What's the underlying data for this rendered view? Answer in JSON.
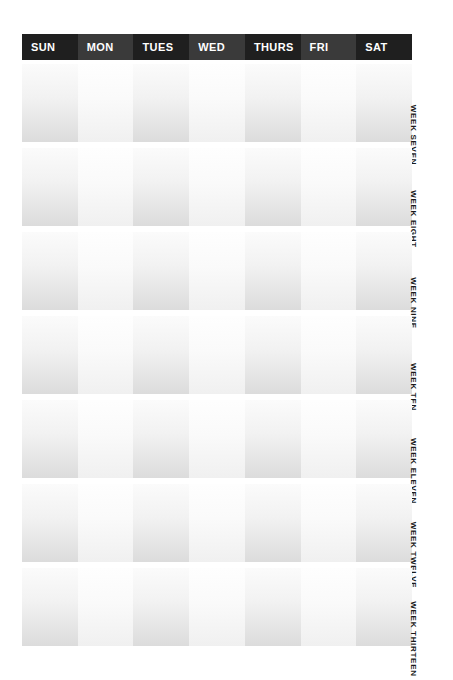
{
  "page": {
    "background_color": "#ffffff",
    "header_color": "#222222",
    "header_text_color": "#ffffff",
    "cell_tint_dark": "#dcdcdc",
    "cell_tint_light": "#f5f5f5",
    "label_text_color": "#1a1a1a"
  },
  "header": {
    "days": [
      {
        "label": "SUN",
        "shade": "dark"
      },
      {
        "label": "MON",
        "shade": "light"
      },
      {
        "label": "TUES",
        "shade": "dark"
      },
      {
        "label": "WED",
        "shade": "light"
      },
      {
        "label": "THURS",
        "shade": "dark"
      },
      {
        "label": "FRI",
        "shade": "light"
      },
      {
        "label": "SAT",
        "shade": "dark"
      }
    ]
  },
  "weeks": [
    {
      "label": "WEEK SEVEN",
      "cells": [
        {
          "day": "SUN",
          "value": ""
        },
        {
          "day": "MON",
          "value": ""
        },
        {
          "day": "TUES",
          "value": ""
        },
        {
          "day": "WED",
          "value": ""
        },
        {
          "day": "THURS",
          "value": ""
        },
        {
          "day": "FRI",
          "value": ""
        },
        {
          "day": "SAT",
          "value": ""
        }
      ]
    },
    {
      "label": "WEEK EIGHT",
      "cells": [
        {
          "day": "SUN",
          "value": ""
        },
        {
          "day": "MON",
          "value": ""
        },
        {
          "day": "TUES",
          "value": ""
        },
        {
          "day": "WED",
          "value": ""
        },
        {
          "day": "THURS",
          "value": ""
        },
        {
          "day": "FRI",
          "value": ""
        },
        {
          "day": "SAT",
          "value": ""
        }
      ]
    },
    {
      "label": "WEEK NINE",
      "cells": [
        {
          "day": "SUN",
          "value": ""
        },
        {
          "day": "MON",
          "value": ""
        },
        {
          "day": "TUES",
          "value": ""
        },
        {
          "day": "WED",
          "value": ""
        },
        {
          "day": "THURS",
          "value": ""
        },
        {
          "day": "FRI",
          "value": ""
        },
        {
          "day": "SAT",
          "value": ""
        }
      ]
    },
    {
      "label": "WEEK TEN",
      "cells": [
        {
          "day": "SUN",
          "value": ""
        },
        {
          "day": "MON",
          "value": ""
        },
        {
          "day": "TUES",
          "value": ""
        },
        {
          "day": "WED",
          "value": ""
        },
        {
          "day": "THURS",
          "value": ""
        },
        {
          "day": "FRI",
          "value": ""
        },
        {
          "day": "SAT",
          "value": ""
        }
      ]
    },
    {
      "label": "WEEK ELEVEN",
      "cells": [
        {
          "day": "SUN",
          "value": ""
        },
        {
          "day": "MON",
          "value": ""
        },
        {
          "day": "TUES",
          "value": ""
        },
        {
          "day": "WED",
          "value": ""
        },
        {
          "day": "THURS",
          "value": ""
        },
        {
          "day": "FRI",
          "value": ""
        },
        {
          "day": "SAT",
          "value": ""
        }
      ]
    },
    {
      "label": "WEEK TWELVE",
      "cells": [
        {
          "day": "SUN",
          "value": ""
        },
        {
          "day": "MON",
          "value": ""
        },
        {
          "day": "TUES",
          "value": ""
        },
        {
          "day": "WED",
          "value": ""
        },
        {
          "day": "THURS",
          "value": ""
        },
        {
          "day": "FRI",
          "value": ""
        },
        {
          "day": "SAT",
          "value": ""
        }
      ]
    },
    {
      "label": "WEEK THIRTEEN",
      "cells": [
        {
          "day": "SUN",
          "value": ""
        },
        {
          "day": "MON",
          "value": ""
        },
        {
          "day": "TUES",
          "value": ""
        },
        {
          "day": "WED",
          "value": ""
        },
        {
          "day": "THURS",
          "value": ""
        },
        {
          "day": "FRI",
          "value": ""
        },
        {
          "day": "SAT",
          "value": ""
        }
      ]
    }
  ]
}
